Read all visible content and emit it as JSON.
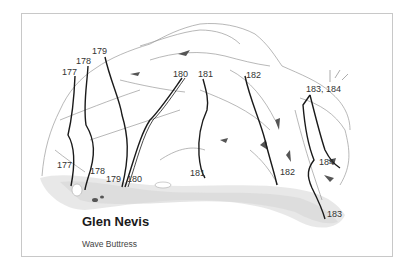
{
  "topo": {
    "title": "Glen Nevis",
    "subtitle": "Wave Buttress",
    "colors": {
      "frame": "#c8c8c8",
      "route_line": "#1a1a1a",
      "rock_outline": "#9a9a9a",
      "ground_stipple": "#cfcfcf"
    },
    "top_labels": [
      {
        "id": "177",
        "text": "177"
      },
      {
        "id": "178",
        "text": "178"
      },
      {
        "id": "179",
        "text": "179"
      },
      {
        "id": "180",
        "text": "180"
      },
      {
        "id": "181",
        "text": "181"
      },
      {
        "id": "182",
        "text": "182"
      },
      {
        "id": "183-184",
        "text": "183, 184"
      }
    ],
    "bottom_labels": [
      {
        "id": "177",
        "text": "177"
      },
      {
        "id": "178",
        "text": "178"
      },
      {
        "id": "179",
        "text": "179"
      },
      {
        "id": "180",
        "text": "180"
      },
      {
        "id": "181",
        "text": "181"
      },
      {
        "id": "182",
        "text": "182"
      },
      {
        "id": "184",
        "text": "184"
      },
      {
        "id": "183",
        "text": "183"
      }
    ]
  }
}
